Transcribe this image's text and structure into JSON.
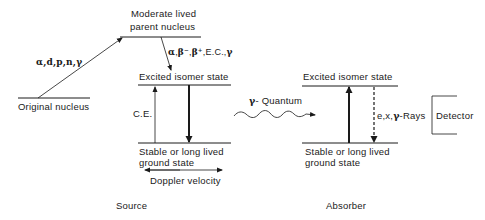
{
  "diagram": {
    "source": {
      "original_nucleus": "Original nucleus",
      "parent_line1": "Moderate lived",
      "parent_line2": "parent nucleus",
      "production_particles": "α,d,p,n,γ",
      "decay_modes": {
        "alpha": "α",
        "beta_minus": "β⁻",
        "beta_plus": "β⁺",
        "rest": ",E.C.,",
        "gamma": "γ"
      },
      "excited_state": "Excited isomer state",
      "conversion": "C.E.",
      "ground_line1": "Stable or long lived",
      "ground_line2": "ground state",
      "doppler": "Doppler velocity",
      "label": "Source"
    },
    "transfer": {
      "gamma_symbol": "γ",
      "quantum_label": "- Quantum"
    },
    "absorber": {
      "excited_state": "Excited isomer state",
      "emission_prefix": "e,x,",
      "emission_gamma": "γ",
      "emission_suffix": "-Rays",
      "ground_line1": "Stable or long lived",
      "ground_line2": "ground state",
      "label": "Absorber"
    },
    "detector": {
      "label": "Detector"
    },
    "colors": {
      "line": "#1a1a1a",
      "background": "#ffffff"
    }
  }
}
